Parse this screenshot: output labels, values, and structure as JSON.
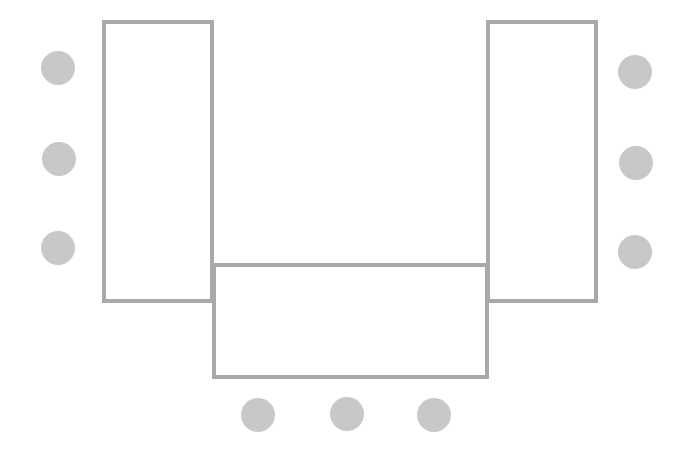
{
  "diagram": {
    "title": "",
    "layout": "U-shape seating",
    "colors": {
      "table_border": "#a9a9a9",
      "seat_fill": "#c8c8c8",
      "background": "#ffffff"
    },
    "tables": [
      {
        "id": "left-table",
        "x": 102,
        "y": 20,
        "w": 112,
        "h": 283
      },
      {
        "id": "right-table",
        "x": 486,
        "y": 20,
        "w": 112,
        "h": 283
      },
      {
        "id": "bottom-table",
        "x": 212,
        "y": 263,
        "w": 277,
        "h": 116
      }
    ],
    "seats": [
      {
        "group": "left",
        "cx": 58,
        "cy": 68
      },
      {
        "group": "left",
        "cx": 59,
        "cy": 159
      },
      {
        "group": "left",
        "cx": 58,
        "cy": 248
      },
      {
        "group": "right",
        "cx": 635,
        "cy": 72
      },
      {
        "group": "right",
        "cx": 636,
        "cy": 163
      },
      {
        "group": "right",
        "cx": 635,
        "cy": 252
      },
      {
        "group": "bottom",
        "cx": 258,
        "cy": 415
      },
      {
        "group": "bottom",
        "cx": 347,
        "cy": 414
      },
      {
        "group": "bottom",
        "cx": 434,
        "cy": 415
      }
    ]
  }
}
